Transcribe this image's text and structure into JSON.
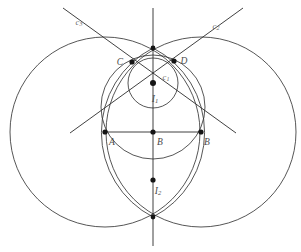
{
  "figure": {
    "width": 301,
    "height": 252,
    "background_color": "#ffffff",
    "stroke_color": "#2b2b2b",
    "label_color": "#4a4a4a",
    "curve_label_color": "#6d6d6d"
  },
  "points": [
    {
      "id": "C",
      "label": "C",
      "sub": "",
      "x": 132,
      "y": 62,
      "label_x": 120,
      "label_y": 63
    },
    {
      "id": "D",
      "label": "D",
      "sub": "",
      "x": 174,
      "y": 61,
      "label_x": 184,
      "label_y": 62
    },
    {
      "id": "A",
      "label": "A",
      "sub": "",
      "x": 105,
      "y": 132,
      "label_x": 112,
      "label_y": 143
    },
    {
      "id": "M",
      "label": "M",
      "sub": "",
      "x": 153,
      "y": 132,
      "label_x": 160,
      "label_y": 143
    },
    {
      "id": "B",
      "label": "B",
      "sub": "",
      "x": 201,
      "y": 132,
      "label_x": 207,
      "label_y": 143
    },
    {
      "id": "I1",
      "label": "I",
      "sub": "1",
      "x": 153,
      "y": 83,
      "label_x": 155,
      "label_y": 100
    },
    {
      "id": "I2",
      "label": "I",
      "sub": "2",
      "x": 153,
      "y": 180,
      "label_x": 158,
      "label_y": 192
    },
    {
      "id": "T",
      "label": "",
      "sub": "",
      "x": 153,
      "y": 48,
      "label_x": 0,
      "label_y": 0
    },
    {
      "id": "S",
      "label": "",
      "sub": "",
      "x": 153,
      "y": 217,
      "label_x": 0,
      "label_y": 0
    }
  ],
  "curve_labels": [
    {
      "id": "c3",
      "label": "c",
      "sub": "3",
      "x": 79,
      "y": 23
    },
    {
      "id": "c2",
      "label": "c",
      "sub": "2",
      "x": 216,
      "y": 27
    },
    {
      "id": "c1",
      "label": "c",
      "sub": "1",
      "x": 166,
      "y": 78
    }
  ],
  "circles": [
    {
      "id": "big-left",
      "cx": 105,
      "cy": 132,
      "r": 95
    },
    {
      "id": "big-right",
      "cx": 201,
      "cy": 132,
      "r": 95
    },
    {
      "id": "circumcircle-abcd",
      "cx": 153,
      "cy": 107,
      "r": 52
    },
    {
      "id": "incircle-c1",
      "cx": 153,
      "cy": 83,
      "r": 25
    }
  ],
  "arcs": [
    {
      "id": "vesica-left-arc",
      "d": "M 153 48 A 95 95 0 0 0 153 217"
    },
    {
      "id": "vesica-right-arc",
      "d": "M 153 48 A 95 95 0 0 1 153 217"
    }
  ],
  "lines": [
    {
      "id": "segment-AB",
      "x1": 105,
      "y1": 132,
      "x2": 201,
      "y2": 132
    },
    {
      "id": "vertical-axis",
      "x1": 153,
      "y1": 8,
      "x2": 153,
      "y2": 246
    },
    {
      "id": "ray-c3",
      "x1": 63,
      "y1": 8,
      "x2": 236,
      "y2": 133
    },
    {
      "id": "ray-c2",
      "x1": 243,
      "y1": 8,
      "x2": 70,
      "y2": 133
    }
  ]
}
